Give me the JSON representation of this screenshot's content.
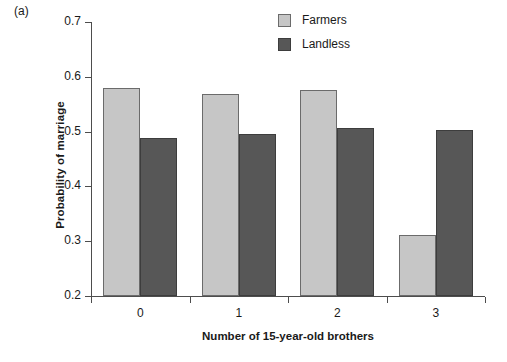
{
  "figure": {
    "panel_label": "(a)",
    "background_color": "#ffffff"
  },
  "chart_data": {
    "type": "bar",
    "title": "",
    "panel_label": "(a)",
    "categories": [
      "0",
      "1",
      "2",
      "3"
    ],
    "series": [
      {
        "name": "Farmers",
        "color": "#c6c6c6",
        "values": [
          0.579,
          0.568,
          0.576,
          0.312
        ]
      },
      {
        "name": "Landless",
        "color": "#575757",
        "values": [
          0.489,
          0.496,
          0.506,
          0.503
        ]
      }
    ],
    "xlabel": "Number of 15-year-old brothers",
    "ylabel": "Probability of marriage",
    "ylim": [
      0.2,
      0.7
    ],
    "yticks": [
      0.2,
      0.3,
      0.4,
      0.5,
      0.6,
      0.7
    ],
    "ytick_labels": [
      "0.2",
      "0.3",
      "0.4",
      "0.5",
      "0.6",
      "0.7"
    ],
    "xtick_labels": [
      "0",
      "1",
      "2",
      "3"
    ],
    "grid": false,
    "legend_position": "top-right",
    "legend_entries": [
      "Farmers",
      "Landless"
    ]
  }
}
